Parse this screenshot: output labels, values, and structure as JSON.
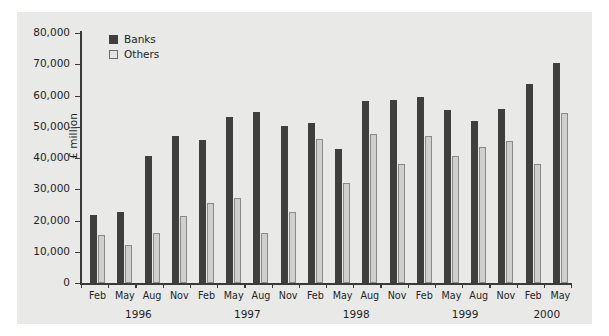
{
  "chart_data": {
    "type": "bar",
    "title": "",
    "subtitle": "",
    "xlabel": "",
    "ylabel": "£ million",
    "ylim": [
      0,
      80000
    ],
    "ytick_labels": [
      "80,000",
      "70,000",
      "60,000",
      "50,000",
      "40,000",
      "30,000",
      "20,000",
      "10,000",
      "0"
    ],
    "ytick_values": [
      80000,
      70000,
      60000,
      50000,
      40000,
      30000,
      20000,
      10000,
      0
    ],
    "grid": false,
    "legend_position": "top-left-inside",
    "categories": [
      "Feb",
      "May",
      "Aug",
      "Nov",
      "Feb",
      "May",
      "Aug",
      "Nov",
      "Feb",
      "May",
      "Aug",
      "Nov",
      "Feb",
      "May",
      "Aug",
      "Nov",
      "Feb",
      "May"
    ],
    "group_labels": [
      "1996",
      "1997",
      "1998",
      "1999",
      "2000"
    ],
    "group_spans": [
      {
        "label": "1996",
        "start": 0,
        "end": 3
      },
      {
        "label": "1997",
        "start": 4,
        "end": 7
      },
      {
        "label": "1998",
        "start": 8,
        "end": 11
      },
      {
        "label": "1999",
        "start": 12,
        "end": 15
      },
      {
        "label": "2000",
        "start": 16,
        "end": 17
      }
    ],
    "series": [
      {
        "name": "Banks",
        "color": "#3f3f3f",
        "values": [
          21800,
          22800,
          40800,
          47100,
          45700,
          53000,
          54700,
          50300,
          51200,
          43000,
          58200,
          58700,
          59600,
          55400,
          52000,
          55800,
          63700,
          70400
        ]
      },
      {
        "name": "Others",
        "color": "#cfcfcd",
        "values": [
          15300,
          12200,
          15900,
          21300,
          25600,
          27100,
          16000,
          22700,
          46000,
          32000,
          47800,
          38000,
          47000,
          40600,
          43400,
          45300,
          38200,
          54500
        ]
      }
    ]
  },
  "legend": {
    "items": [
      {
        "label": "Banks",
        "color": "#3f3f3f"
      },
      {
        "label": "Others",
        "color": "#e4e4e2"
      }
    ]
  }
}
